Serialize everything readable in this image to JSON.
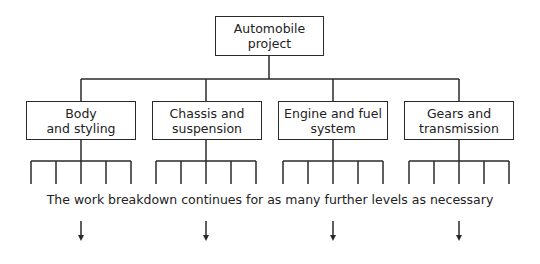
{
  "diagram": {
    "type": "work-breakdown-structure",
    "root": {
      "label": "Automobile\nproject"
    },
    "children": [
      {
        "label": "Body\nand styling"
      },
      {
        "label": "Chassis and\nsuspension"
      },
      {
        "label": "Engine and fuel\nsystem"
      },
      {
        "label": "Gears and\ntransmission"
      }
    ],
    "leaves_per_child": 5,
    "note": "The work breakdown continues for as many further levels as necessary",
    "arrows": 4,
    "line_color": "#2a2a2a"
  }
}
